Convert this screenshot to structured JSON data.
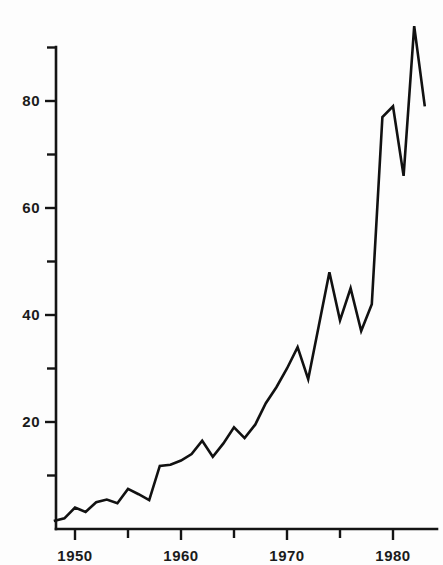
{
  "chart_data": {
    "type": "line",
    "title": "",
    "subtitle": "",
    "xlabel": "",
    "ylabel": "",
    "xlim": [
      1948,
      1984
    ],
    "ylim": [
      0,
      92
    ],
    "grid": false,
    "legend": null,
    "x_tick_labels": [
      "1950",
      "1960",
      "1970",
      "1980"
    ],
    "x_major_ticks": [
      1950,
      1960,
      1970,
      1980
    ],
    "x_minor_ticks": [
      1955,
      1965,
      1975
    ],
    "y_tick_labels": [
      "20",
      "40",
      "60",
      "80"
    ],
    "y_major_ticks": [
      20,
      40,
      60,
      80
    ],
    "y_minor_ticks": [
      10,
      30,
      50,
      70,
      90
    ],
    "series": [
      {
        "name": "series-1",
        "color": "#111111",
        "x": [
          1948,
          1949,
          1950,
          1951,
          1952,
          1953,
          1954,
          1955,
          1956,
          1957,
          1958,
          1959,
          1960,
          1961,
          1962,
          1963,
          1964,
          1965,
          1966,
          1967,
          1968,
          1969,
          1970,
          1971,
          1972,
          1973,
          1974,
          1975,
          1976,
          1977,
          1978,
          1979,
          1980,
          1981,
          1982,
          1983
        ],
        "values": [
          1.5,
          2.0,
          4.0,
          3.2,
          5.0,
          5.5,
          4.8,
          7.5,
          6.5,
          5.4,
          11.8,
          12.0,
          12.8,
          14.0,
          16.5,
          13.5,
          16.0,
          19.0,
          17.0,
          19.5,
          23.5,
          26.5,
          30.0,
          34.0,
          28.0,
          38.0,
          48.0,
          39.0,
          45.0,
          37.0,
          42.0,
          77.0,
          79.0,
          66.0,
          94.0,
          79.0
        ]
      }
    ]
  },
  "axes": {
    "x_axis_name": "x-axis-years",
    "y_axis_name": "y-axis-values"
  },
  "geometry": {
    "plot_left": 56,
    "plot_bottom": 529,
    "plot_top": 47,
    "plot_right": 437,
    "x_origin_year": 1950,
    "x_origin_px": 75,
    "px_per_year": 10.6,
    "y_zero_px": 529,
    "px_per_unit": 5.35
  }
}
